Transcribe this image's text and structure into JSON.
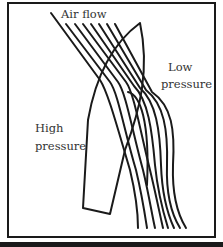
{
  "diagram": {
    "labels": {
      "air_flow": "Air flow",
      "low_pressure_line1": "Low",
      "low_pressure_line2": "pressure",
      "high_pressure_line1": "High",
      "high_pressure_line2": "pressure"
    },
    "elements": {
      "sail": "sail outline (curved, pointed tip, rectangular foot)",
      "streamline_count": 8,
      "line_color": "#1a1a1a",
      "text_color": "#333333",
      "background": "#ffffff"
    }
  }
}
